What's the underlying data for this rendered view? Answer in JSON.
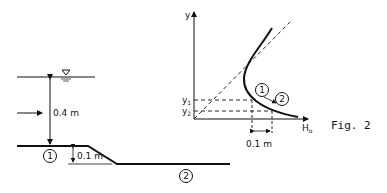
{
  "figure_label": "Fig. 2",
  "channel": {
    "depth_label": "0.4 m",
    "step_label": "0.1 m",
    "section_1": "1",
    "section_2": "2",
    "water_surface_symbol": "free-surface-triangle"
  },
  "energy_diagram": {
    "y_axis_label": "y",
    "x_axis_label": "H",
    "x_axis_subscript": "o",
    "y1_label": "y",
    "y1_sub": "1",
    "y2_label": "y",
    "y2_sub": "2",
    "dh_label": "0.1 m",
    "point_1": "1",
    "point_2": "2"
  }
}
